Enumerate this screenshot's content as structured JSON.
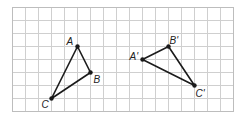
{
  "figure": {
    "grid": {
      "origin_x": 12.5,
      "origin_y": 7.5,
      "cell": 13,
      "cols": 17,
      "rows": 8,
      "line_color": "#cfcfcf",
      "border_color": "#bdbdbd"
    },
    "stroke_color": "#1a1a1a",
    "triangles": [
      {
        "name": "ABC",
        "vertices": [
          {
            "label": "A",
            "col": 5,
            "row": 3,
            "dx": -11,
            "dy": -2
          },
          {
            "label": "B",
            "col": 6,
            "row": 5,
            "dx": 3,
            "dy": 10
          },
          {
            "label": "C",
            "col": 3,
            "row": 7,
            "dx": -10,
            "dy": 9
          }
        ]
      },
      {
        "name": "A'B'C'",
        "vertices": [
          {
            "label": "A'",
            "col": 10,
            "row": 4,
            "dx": -13,
            "dy": 0
          },
          {
            "label": "B'",
            "col": 12,
            "row": 3,
            "dx": 1,
            "dy": -3
          },
          {
            "label": "C'",
            "col": 14,
            "row": 6,
            "dx": 1,
            "dy": 11
          }
        ]
      }
    ]
  }
}
